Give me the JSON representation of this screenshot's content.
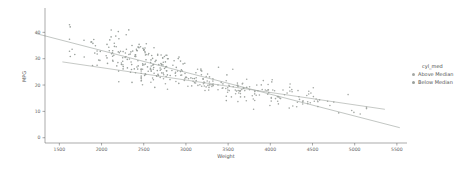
{
  "chart_data": {
    "type": "scatter",
    "title": "",
    "xlabel": "Weight",
    "ylabel": "MPG",
    "xlim": [
      1330,
      5620
    ],
    "ylim": [
      -2,
      50
    ],
    "xticks": [
      1500,
      2000,
      2500,
      3000,
      3500,
      4000,
      4500,
      5000,
      5500
    ],
    "yticks": [
      0,
      10,
      20,
      30,
      40
    ],
    "grid": false,
    "background": "#ffffff",
    "axis_color": "#555555",
    "tick_text_color": "#666666",
    "legend": {
      "title": "cyl_med",
      "position": "right",
      "entries": [
        {
          "label": "Above Median",
          "color": "#a4a8a4"
        },
        {
          "label": "Below Median",
          "color": "#9aa09c"
        }
      ]
    },
    "series": [
      {
        "name": "Above Median",
        "n": 190,
        "seed": 7,
        "weight_mean": 3700,
        "weight_sd": 650,
        "weight_range": [
          2470,
          5140
        ],
        "mpg_intercept": 36.4,
        "mpg_slope": -0.0049,
        "noise_sd": 2.2,
        "mpg_range": [
          9,
          26
        ],
        "color": "#a4a8a4",
        "marker_radius": 0.8
      },
      {
        "name": "Below Median",
        "n": 200,
        "seed": 13,
        "weight_mean": 2400,
        "weight_sd": 420,
        "weight_range": [
          1620,
          3500
        ],
        "mpg_intercept": 50.8,
        "mpg_slope": -0.00863,
        "noise_sd": 3.8,
        "mpg_range": [
          14,
          48
        ],
        "color": "#9aa09c",
        "marker_radius": 0.8
      }
    ],
    "trendlines": [
      {
        "series": "Below Median",
        "x1": 1216,
        "y1": 39.6,
        "x2": 5535,
        "y2": 3.8,
        "color": "#98a09a",
        "width": 0.6
      },
      {
        "series": "Above Median",
        "x1": 1536,
        "y1": 28.8,
        "x2": 5358,
        "y2": 10.8,
        "color": "#a0a5a0",
        "width": 0.6
      }
    ]
  }
}
